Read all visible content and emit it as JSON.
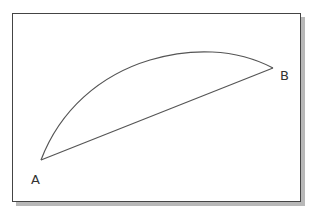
{
  "diagram": {
    "type": "arc-and-chord",
    "points": {
      "A": {
        "label": "A",
        "x": 41,
        "y": 160
      },
      "B": {
        "label": "B",
        "x": 273,
        "y": 68
      }
    },
    "arc": {
      "from": "A",
      "to": "B",
      "peak": {
        "x": 200,
        "y": 52
      }
    },
    "chord": {
      "from": "A",
      "to": "B"
    },
    "colors": {
      "stroke": "#555555",
      "frame": "#444444",
      "shadow": "#b8b8b8"
    }
  }
}
